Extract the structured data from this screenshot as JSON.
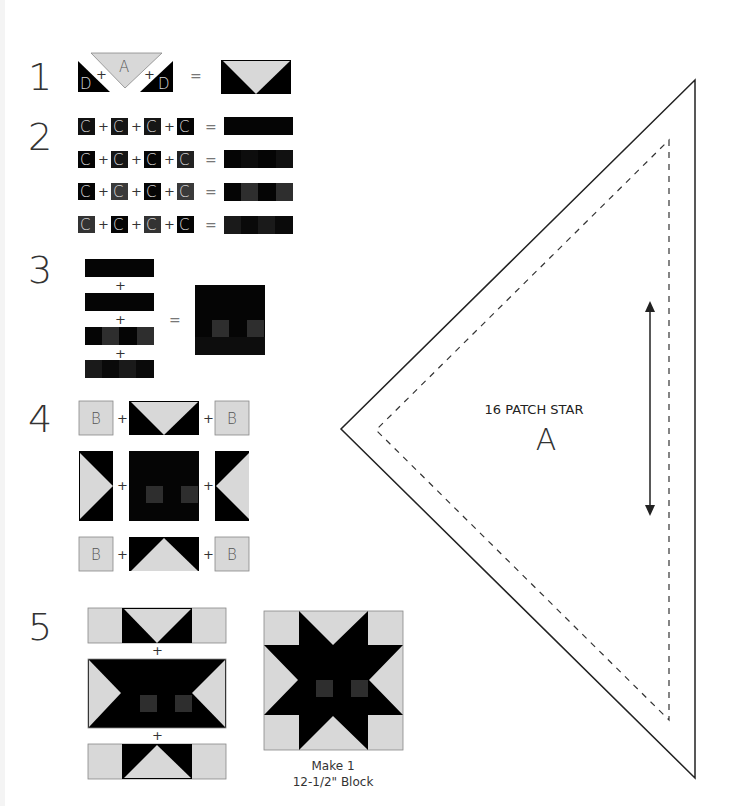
{
  "colors": {
    "dark": "#0a0a0a",
    "black": "#000000",
    "medium": "#3a3a3a",
    "light": "#d8d8d8",
    "outline": "#888888",
    "line": "#222222"
  },
  "steps": [
    {
      "number": "1",
      "labels": {
        "left_piece": "D",
        "center_piece": "A",
        "right_piece": "D",
        "plus": "+",
        "equals": "="
      }
    },
    {
      "number": "2",
      "piece_label": "C",
      "plus": "+",
      "equals": "=",
      "rows": [
        [
          "dark",
          "dark",
          "dark",
          "black"
        ],
        [
          "black",
          "dark",
          "black",
          "dark"
        ],
        [
          "black",
          "medium",
          "black",
          "medium"
        ],
        [
          "medium",
          "black",
          "medium",
          "black"
        ]
      ]
    },
    {
      "number": "3",
      "plus": "+",
      "equals": "="
    },
    {
      "number": "4",
      "corner_label": "B",
      "plus": "+"
    },
    {
      "number": "5",
      "plus": "+",
      "caption_line1": "Make 1",
      "caption_line2": "12-1/2\" Block"
    }
  ],
  "template": {
    "title": "16 PATCH STAR",
    "letter": "A",
    "grainline": "double-arrow"
  }
}
